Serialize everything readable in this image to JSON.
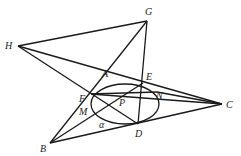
{
  "figure": {
    "points": {
      "H": {
        "label": "H",
        "x": 18,
        "y": 46
      },
      "G": {
        "label": "G",
        "x": 147,
        "y": 21
      },
      "A": {
        "label": "A",
        "x": 108,
        "y": 77
      },
      "E": {
        "label": "E",
        "x": 143,
        "y": 83
      },
      "F": {
        "label": "F",
        "x": 91,
        "y": 94
      },
      "P": {
        "label": "P",
        "x": 123,
        "y": 100
      },
      "N": {
        "label": "N",
        "x": 157,
        "y": 97
      },
      "M": {
        "label": "M",
        "x": 88,
        "y": 104
      },
      "D": {
        "label": "D",
        "x": 138,
        "y": 124
      },
      "C": {
        "label": "C",
        "x": 222,
        "y": 104
      },
      "B": {
        "label": "B",
        "x": 50,
        "y": 143
      }
    },
    "angle_label": "α",
    "ellipse": {
      "cx": 125,
      "cy": 104,
      "rx": 34,
      "ry": 20
    }
  }
}
